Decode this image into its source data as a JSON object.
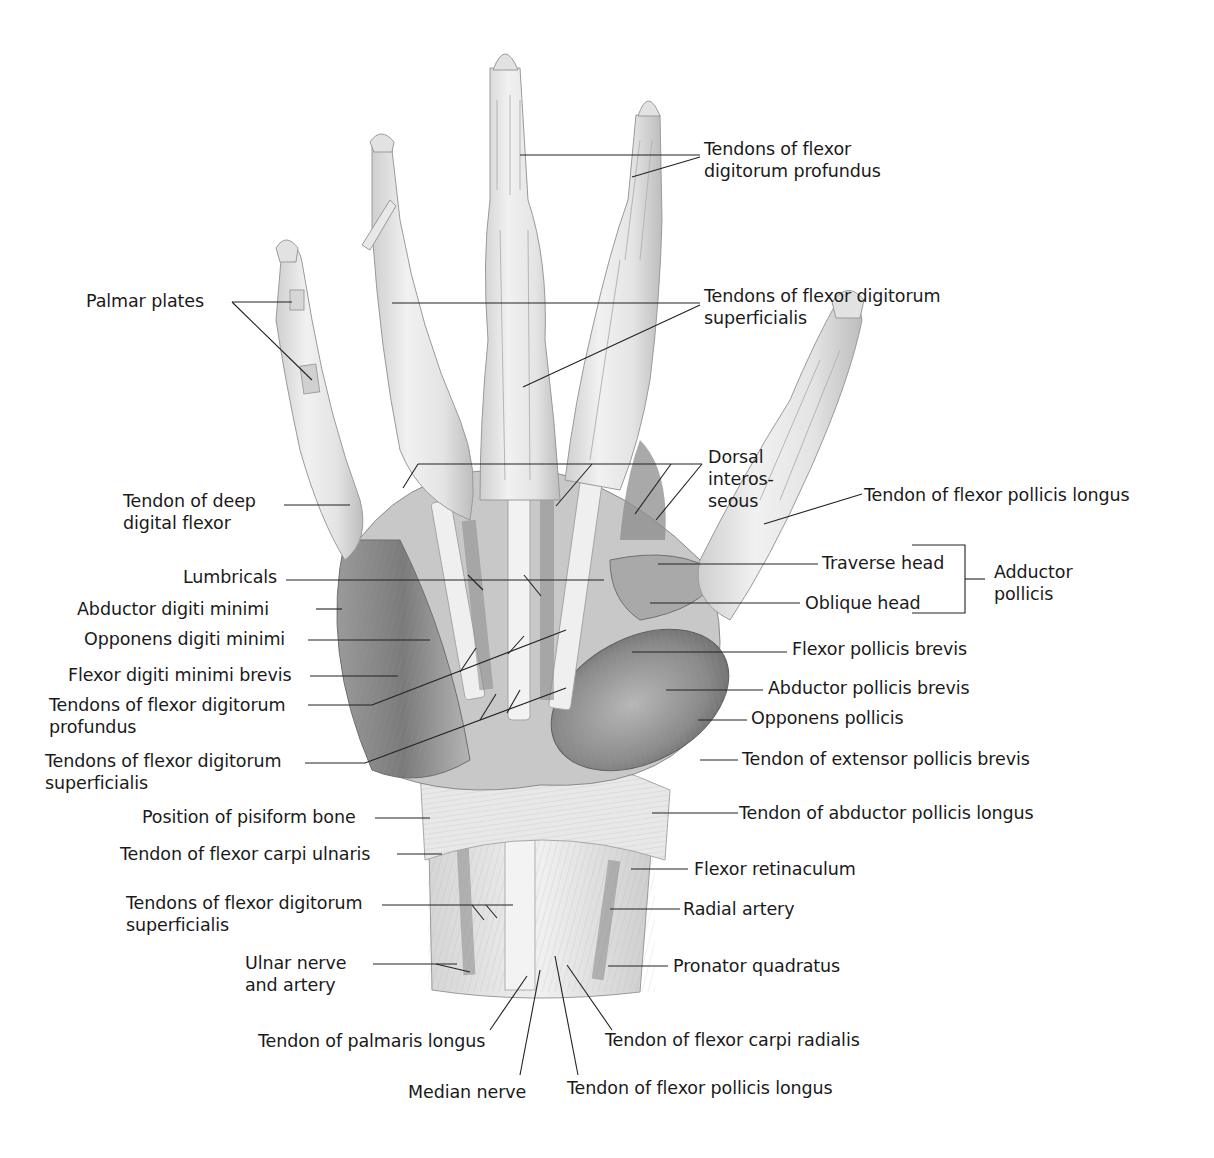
{
  "figure": {
    "colors": {
      "background": "#ffffff",
      "text": "#1a1a1a",
      "leader": "#222222",
      "illustration_light": "#e6e6e6",
      "illustration_dark": "#6e6e6e"
    }
  },
  "labels": {
    "tendons_fdp_top": {
      "l1": "Tendons of flexor",
      "l2": "digitorum profundus"
    },
    "palmar_plates": {
      "l1": "Palmar plates"
    },
    "tendons_fds_top": {
      "l1": "Tendons of flexor digitorum",
      "l2": "superficialis"
    },
    "dorsal_interosseous": {
      "l1": "Dorsal",
      "l2": "interos-",
      "l3": "seous"
    },
    "tendon_deep_digital_flexor": {
      "l1": "Tendon of deep",
      "l2": "digital flexor"
    },
    "tendon_fpl_thumb": {
      "l1": "Tendon of flexor pollicis longus"
    },
    "traverse_head": {
      "l1": "Traverse head"
    },
    "oblique_head": {
      "l1": "Oblique head"
    },
    "adductor_pollicis": {
      "l1": "Adductor",
      "l2": "pollicis"
    },
    "lumbricals": {
      "l1": "Lumbricals"
    },
    "abductor_digiti_minimi": {
      "l1": "Abductor digiti minimi"
    },
    "opponens_digiti_minimi": {
      "l1": "Opponens digiti minimi"
    },
    "flexor_digiti_minimi_brevis": {
      "l1": "Flexor digiti minimi brevis"
    },
    "tendons_fdp_palm": {
      "l1": "Tendons of flexor digitorum",
      "l2": "profundus"
    },
    "tendons_fds_palm": {
      "l1": "Tendons of flexor digitorum",
      "l2": "superficialis"
    },
    "flexor_pollicis_brevis": {
      "l1": "Flexor pollicis brevis"
    },
    "abductor_pollicis_brevis": {
      "l1": "Abductor pollicis brevis"
    },
    "opponens_pollicis": {
      "l1": "Opponens pollicis"
    },
    "tendon_epb": {
      "l1": "Tendon of extensor pollicis brevis"
    },
    "tendon_apl": {
      "l1": "Tendon of abductor pollicis longus"
    },
    "pisiform": {
      "l1": "Position of pisiform bone"
    },
    "tendon_fcu": {
      "l1": "Tendon of flexor carpi ulnaris"
    },
    "flexor_retinaculum": {
      "l1": "Flexor retinaculum"
    },
    "tendons_fds_wrist": {
      "l1": "Tendons of flexor digitorum",
      "l2": "superficialis"
    },
    "radial_artery": {
      "l1": "Radial artery"
    },
    "ulnar_nerve_artery": {
      "l1": "Ulnar nerve",
      "l2": "and artery"
    },
    "pronator_quadratus": {
      "l1": "Pronator quadratus"
    },
    "tendon_palmaris_longus": {
      "l1": "Tendon of palmaris longus"
    },
    "tendon_fcr": {
      "l1": "Tendon of flexor carpi radialis"
    },
    "median_nerve": {
      "l1": "Median nerve"
    },
    "tendon_fpl_wrist": {
      "l1": "Tendon of flexor pollicis longus"
    }
  }
}
